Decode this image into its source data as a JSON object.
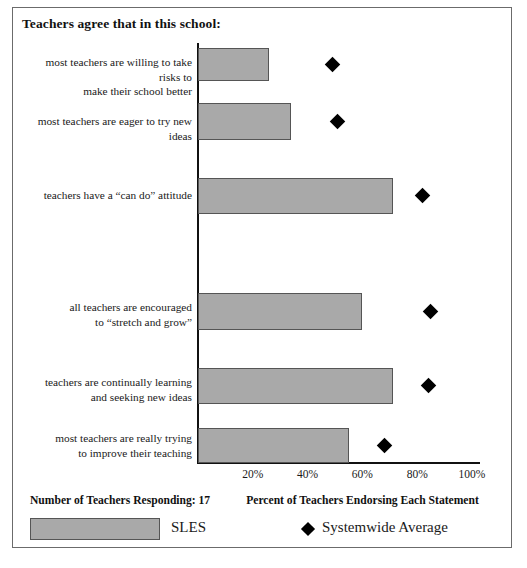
{
  "chart_data": {
    "type": "bar",
    "title": "Teachers agree that in this school:",
    "xlabel": "Percent of Teachers Endorsing Each Statement",
    "ylabel": "",
    "xlim": [
      0,
      100
    ],
    "grid": false,
    "orientation": "horizontal",
    "tick_labels": [
      "20%",
      "40%",
      "60%",
      "80%",
      "100%"
    ],
    "tick_values": [
      20,
      40,
      60,
      80,
      100
    ],
    "categories": [
      "most teachers are willing to take risks to make their school better",
      "most teachers are eager to try new ideas",
      "teachers have a \"can do\" attitude",
      "all teachers are encouraged to \"stretch and grow\"",
      "teachers are continually learning and seeking new ideas",
      "most teachers are really trying to improve their teaching"
    ],
    "category_lines": [
      [
        "most teachers are willing to take risks to",
        "make their school better"
      ],
      [
        "most teachers are eager to try new ideas"
      ],
      [
        "teachers have a “can do” attitude"
      ],
      [
        "all teachers are encouraged",
        "to “stretch and grow”"
      ],
      [
        "teachers are continually learning",
        "and seeking new ideas"
      ],
      [
        "most teachers are really trying",
        "to improve their teaching"
      ]
    ],
    "series": [
      {
        "name": "SLES",
        "type": "bar",
        "color": "#a9a9a9",
        "values": [
          26,
          34,
          71,
          60,
          71,
          55
        ]
      },
      {
        "name": "Systemwide Average",
        "type": "marker",
        "marker": "diamond",
        "color": "#000000",
        "values": [
          49,
          51,
          82,
          85,
          84,
          68
        ]
      }
    ],
    "legend_position": "bottom",
    "legend_entries": [
      "SLES",
      "Systemwide Average"
    ],
    "annotations": {
      "respondents": "Number of Teachers Responding: 17"
    }
  },
  "chart": {
    "title": "Teachers agree that in this school:",
    "axis_caption": "Percent of Teachers Endorsing Each Statement",
    "respondents_caption": "Number of Teachers Responding: 17",
    "ticks": [
      {
        "label": "20%"
      },
      {
        "label": "40%"
      },
      {
        "label": "60%"
      },
      {
        "label": "80%"
      },
      {
        "label": "100%"
      }
    ],
    "rows": [
      {
        "line1": "most teachers are willing to take risks to",
        "line2": "make their school better"
      },
      {
        "line1": "most teachers are eager to try new ideas",
        "line2": ""
      },
      {
        "line1": "teachers have a “can do” attitude",
        "line2": ""
      },
      {
        "line1": "all teachers are encouraged",
        "line2": "to “stretch and grow”"
      },
      {
        "line1": "teachers are continually learning",
        "line2": "and seeking new ideas"
      },
      {
        "line1": "most teachers are really trying",
        "line2": "to improve their teaching"
      }
    ],
    "legend": {
      "bar_label": "SLES",
      "marker_label": "Systemwide Average",
      "marker_glyph": "◆"
    }
  },
  "colors": {
    "bar_fill": "#a9a9a9",
    "bar_stroke": "#555555",
    "marker": "#000000",
    "frame": "#6b6b6b",
    "axis": "#111111",
    "text": "#1a1a1a"
  }
}
